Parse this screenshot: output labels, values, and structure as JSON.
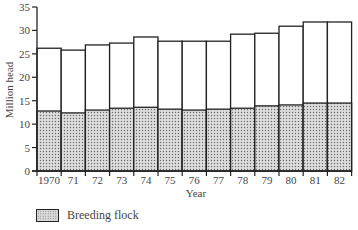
{
  "chart_data": {
    "type": "bar",
    "stacked": true,
    "title": "",
    "xlabel": "Year",
    "ylabel": "Million head",
    "ylim": [
      0,
      35
    ],
    "yticks": [
      0,
      5,
      10,
      15,
      20,
      25,
      30,
      35
    ],
    "grid": false,
    "categories": [
      "1970",
      "71",
      "72",
      "73",
      "74",
      "75",
      "76",
      "77",
      "78",
      "79",
      "80",
      "81",
      "82"
    ],
    "series": [
      {
        "name": "Breeding flock",
        "pattern": "stipple",
        "values": [
          12.8,
          12.4,
          13.0,
          13.4,
          13.6,
          13.2,
          13.0,
          13.2,
          13.4,
          13.9,
          14.1,
          14.5,
          14.5
        ]
      },
      {
        "name": "Total",
        "pattern": "none",
        "values": [
          26.2,
          25.8,
          26.9,
          27.3,
          28.6,
          27.7,
          27.7,
          27.7,
          29.2,
          29.4,
          30.9,
          31.8,
          31.8
        ]
      }
    ],
    "legend": {
      "position": "bottom-left",
      "entries": [
        "Breeding flock"
      ]
    }
  },
  "axes": {
    "xlabel": "Year",
    "ylabel": "Million head"
  },
  "legend": {
    "label": "Breeding flock"
  }
}
